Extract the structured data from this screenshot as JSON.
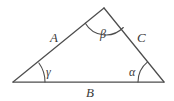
{
  "figure": {
    "type": "geometry-diagram",
    "shape": "triangle",
    "background_color": "#ffffff",
    "stroke_color": "#4d4d4d",
    "label_color": "#3a3a3a",
    "vertices": [
      {
        "name": "left-vertex",
        "x": 13,
        "y": 82
      },
      {
        "name": "apex-vertex",
        "x": 104,
        "y": 8
      },
      {
        "name": "right-vertex",
        "x": 164,
        "y": 82
      }
    ],
    "sides": [
      {
        "id": "A",
        "label": "A",
        "from": "left-vertex",
        "to": "apex-vertex",
        "label_x": 50,
        "label_y": 31
      },
      {
        "id": "C",
        "label": "C",
        "from": "apex-vertex",
        "to": "right-vertex",
        "label_x": 137,
        "label_y": 31
      },
      {
        "id": "B",
        "label": "B",
        "from": "left-vertex",
        "to": "right-vertex",
        "label_x": 86,
        "label_y": 86
      }
    ],
    "angles": [
      {
        "id": "gamma",
        "label": "γ",
        "at": "left-vertex",
        "label_x": 46,
        "label_y": 66
      },
      {
        "id": "beta",
        "label": "β",
        "at": "apex-vertex",
        "label_x": 100,
        "label_y": 28
      },
      {
        "id": "alpha",
        "label": "α",
        "at": "right-vertex",
        "label_x": 129,
        "label_y": 66
      }
    ]
  }
}
